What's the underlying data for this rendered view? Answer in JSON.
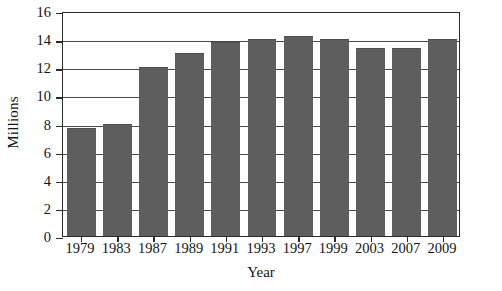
{
  "chart_data": {
    "type": "bar",
    "title": "",
    "subtitle": "",
    "xlabel": "Year",
    "ylabel": "Millions",
    "categories": [
      "1979",
      "1983",
      "1987",
      "1989",
      "1991",
      "1993",
      "1997",
      "1999",
      "2003",
      "2007",
      "2009"
    ],
    "values": [
      7.7,
      8.0,
      12.0,
      13.0,
      13.8,
      14.0,
      14.2,
      14.0,
      13.4,
      13.4,
      14.0
    ],
    "ylim": [
      0,
      16
    ],
    "ytick_step": 2,
    "yticks": [
      "16",
      "14",
      "12",
      "10",
      "8",
      "6",
      "4",
      "2",
      "0"
    ],
    "ytick_values": [
      16,
      14,
      12,
      10,
      8,
      6,
      4,
      2,
      0
    ],
    "grid": "horizontal",
    "legend": "none",
    "bar_color": "#5e5e5e",
    "axis_color": "#2b2b2b",
    "grid_color": "#4a4a4a",
    "background_color": "#ffffff"
  }
}
